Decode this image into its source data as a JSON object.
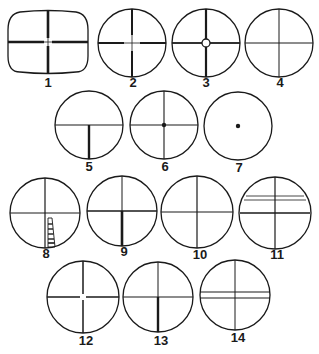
{
  "figure": {
    "ink_color": "#1a1a1a",
    "background": "#ffffff"
  },
  "reticles": [
    {
      "label": "1",
      "shape": "rounded-rect",
      "pattern": "heavy crosshair with thin center gap"
    },
    {
      "label": "2",
      "shape": "circle",
      "pattern": "crosshair, heavy outer posts, thin center"
    },
    {
      "label": "3",
      "shape": "circle",
      "pattern": "crosshair with center circle"
    },
    {
      "label": "4",
      "shape": "circle",
      "pattern": "fine crosshair"
    },
    {
      "label": "5",
      "shape": "circle",
      "pattern": "horizontal wire with post from bottom"
    },
    {
      "label": "6",
      "shape": "circle",
      "pattern": "crosshair with center dot"
    },
    {
      "label": "7",
      "shape": "circle",
      "pattern": "center dot only"
    },
    {
      "label": "8",
      "shape": "circle",
      "pattern": "crosshair with rangefinder scale on lower post"
    },
    {
      "label": "9",
      "shape": "circle",
      "pattern": "crosshair, heavy lower post"
    },
    {
      "label": "10",
      "shape": "circle",
      "pattern": "fine crosshair"
    },
    {
      "label": "11",
      "shape": "circle",
      "pattern": "crosshair with extra upper stadia lines"
    },
    {
      "label": "12",
      "shape": "circle",
      "pattern": "crosshair with thin center"
    },
    {
      "label": "13",
      "shape": "circle",
      "pattern": "crosshair, heavy lower post"
    },
    {
      "label": "14",
      "shape": "circle",
      "pattern": "vertical wire with double horizontal lines"
    }
  ]
}
